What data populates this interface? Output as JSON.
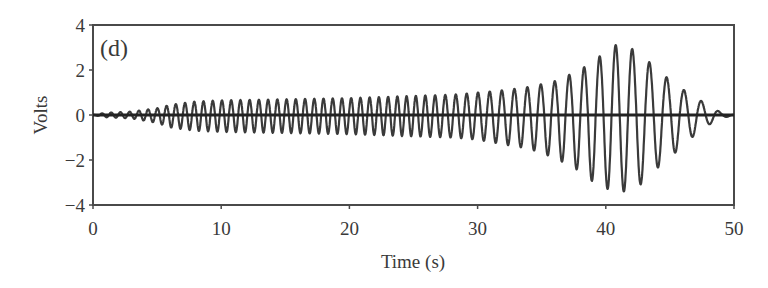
{
  "chart_data": {
    "type": "line",
    "title": "",
    "panel_label": "(d)",
    "xlabel": "Time (s)",
    "ylabel": "Volts",
    "xlim": [
      0,
      50
    ],
    "ylim": [
      -4,
      4
    ],
    "xticks": [
      0,
      10,
      20,
      30,
      40,
      50
    ],
    "yticks": [
      4,
      2,
      0,
      -2,
      -4
    ],
    "grid": false,
    "legend": null,
    "series": [
      {
        "name": "signal",
        "description": "Oscillating voltage signal with growing amplitude peaking near 41 s then decaying to zero by ~49 s",
        "color": "#3a3a3a",
        "envelope_time_s": [
          0,
          1,
          3,
          5,
          6,
          8,
          10,
          15,
          20,
          25,
          28,
          30,
          32,
          34,
          36,
          38,
          39.5,
          41,
          42.2,
          43.5,
          45,
          46.5,
          47.8,
          49,
          50
        ],
        "envelope_positive_V": [
          0,
          0.1,
          0.15,
          0.3,
          0.45,
          0.6,
          0.65,
          0.7,
          0.75,
          0.85,
          0.9,
          1.0,
          1.1,
          1.25,
          1.5,
          2.0,
          2.6,
          3.2,
          2.9,
          2.3,
          1.55,
          0.95,
          0.5,
          0.1,
          0
        ],
        "envelope_negative_V": [
          0,
          -0.1,
          -0.15,
          -0.35,
          -0.55,
          -0.7,
          -0.75,
          -0.8,
          -0.85,
          -0.95,
          -1.0,
          -1.1,
          -1.3,
          -1.5,
          -1.9,
          -2.5,
          -3.2,
          -3.4,
          -3.4,
          -2.6,
          -1.9,
          -1.1,
          -0.5,
          -0.15,
          0
        ],
        "period_early_s": 0.72,
        "period_late_s": 1.35,
        "peak_max": {
          "t": 41,
          "v": 3.2
        },
        "peak_min": {
          "t": 42,
          "v": -3.4
        }
      },
      {
        "name": "zero-baseline",
        "color": "#222222",
        "values": [
          [
            0,
            0
          ],
          [
            50,
            0
          ]
        ]
      }
    ]
  }
}
